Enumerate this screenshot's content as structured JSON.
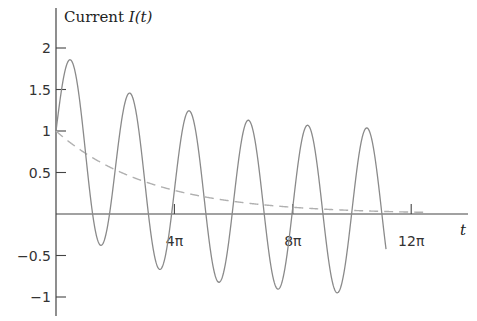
{
  "chart_data": {
    "type": "line",
    "title": "Current I(t)",
    "ylabel": "Current I(t)",
    "xlabel": "t",
    "ylim": [
      -1.15,
      2.3
    ],
    "xlim": [
      0,
      13.4
    ],
    "x_unit": "pi",
    "grid": false,
    "legend": null,
    "y_ticks": [
      {
        "value": 2,
        "label": "2"
      },
      {
        "value": 1.5,
        "label": "1.5"
      },
      {
        "value": 1,
        "label": "1"
      },
      {
        "value": 0.5,
        "label": "0.5"
      },
      {
        "value": -0.5,
        "label": "-0.5"
      },
      {
        "value": -1,
        "label": "-1"
      }
    ],
    "x_ticks": [
      {
        "value_over_pi": 4,
        "label": "4π"
      },
      {
        "value_over_pi": 8,
        "label": "8π"
      },
      {
        "value_over_pi": 12,
        "label": "12π"
      }
    ],
    "series": [
      {
        "name": "I(t) total current",
        "style": "solid",
        "color": "#8a8a8a",
        "formula": "sin(t) + exp(-t/10)",
        "t_range_over_pi": [
          0,
          11.15
        ],
        "peaks": [
          {
            "t_over_pi": 0.7,
            "value": 1.81
          },
          {
            "t_over_pi": 2.6,
            "value": 1.45
          },
          {
            "t_over_pi": 4.6,
            "value": 1.24
          },
          {
            "t_over_pi": 6.6,
            "value": 1.12
          },
          {
            "t_over_pi": 8.6,
            "value": 1.08
          },
          {
            "t_over_pi": 10.6,
            "value": 1.05
          }
        ],
        "troughs": [
          {
            "t_over_pi": 1.6,
            "value": -0.45
          },
          {
            "t_over_pi": 3.6,
            "value": -0.71
          },
          {
            "t_over_pi": 5.6,
            "value": -0.87
          },
          {
            "t_over_pi": 7.6,
            "value": -0.94
          },
          {
            "t_over_pi": 9.6,
            "value": -0.98
          }
        ],
        "end_value": 0.75
      },
      {
        "name": "transient exp(-t/10)",
        "style": "dashed",
        "color": "#b0b0b0",
        "formula": "exp(-t/10)",
        "t_range_over_pi": [
          0,
          12.6
        ],
        "samples": [
          {
            "t_over_pi": 0,
            "value": 1.0
          },
          {
            "t_over_pi": 1.3,
            "value": 0.65
          },
          {
            "t_over_pi": 3.4,
            "value": 0.46
          },
          {
            "t_over_pi": 6.7,
            "value": 0.17
          },
          {
            "t_over_pi": 12.6,
            "value": 0.02
          }
        ]
      }
    ]
  },
  "layout": {
    "origin_x": 56,
    "origin_y": 214,
    "px_per_pi": 29.6,
    "px_per_unit_y": 83,
    "x_axis_end": 468,
    "y_axis_top": 8,
    "y_axis_bottom": 316
  }
}
